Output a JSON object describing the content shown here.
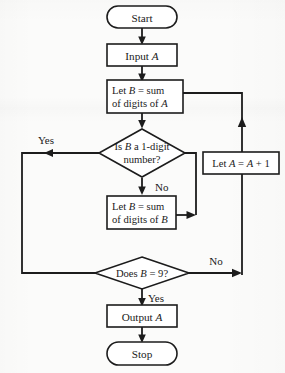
{
  "diagram": {
    "type": "flowchart",
    "background_color": "#fbfbfa",
    "line_color": "#1c1c1c",
    "shape_fill": "#ffffff"
  },
  "nodes": {
    "start": {
      "shape": "terminator",
      "label": "Start"
    },
    "input_a": {
      "shape": "process",
      "label": "Input A",
      "text_plain": "Input ",
      "text_italic": "A"
    },
    "let_b_sum_a": {
      "shape": "process",
      "line1_pre": "Let ",
      "line1_var": "B",
      "line1_post": " = sum",
      "line2_pre": "of digits of ",
      "line2_var": "A",
      "label": "Let B = sum of digits of A"
    },
    "is_b_one_digit": {
      "shape": "decision",
      "line1_pre": "Is ",
      "line1_var": "B",
      "line1_post": " a 1-digit",
      "line2": "number?",
      "label": "Is B a 1-digit number?"
    },
    "let_a_plus_1": {
      "shape": "process",
      "pre": "Let ",
      "var1": "A",
      "mid": " = ",
      "var2": "A",
      "post": " + 1",
      "label": "Let A = A + 1"
    },
    "let_b_sum_b": {
      "shape": "process",
      "line1_pre": "Let ",
      "line1_var": "B",
      "line1_post": " = sum",
      "line2_pre": "of digits of ",
      "line2_var": "B",
      "label": "Let B = sum of digits of B"
    },
    "does_b_equal_9": {
      "shape": "decision",
      "pre": "Does ",
      "var": "B",
      "post": " = 9?",
      "label": "Does B = 9?"
    },
    "output_a": {
      "shape": "process",
      "text_plain": "Output ",
      "text_italic": "A",
      "label": "Output A"
    },
    "stop": {
      "shape": "terminator",
      "label": "Stop"
    }
  },
  "edge_labels": {
    "yes_one_digit": "Yes",
    "no_one_digit": "No",
    "no_equals_9": "No",
    "yes_equals_9": "Yes"
  }
}
